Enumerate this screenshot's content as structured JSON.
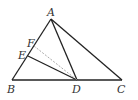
{
  "diagram": {
    "type": "geometry-triangle",
    "points": {
      "A": {
        "label": "A",
        "x": 51,
        "y": 19
      },
      "B": {
        "label": "B",
        "x": 12,
        "y": 80
      },
      "C": {
        "label": "C",
        "x": 122,
        "y": 80
      },
      "D": {
        "label": "D",
        "x": 77,
        "y": 80
      },
      "E": {
        "label": "E",
        "x": 28,
        "y": 56
      },
      "F": {
        "label": "F",
        "x": 34,
        "y": 46
      }
    },
    "segments": [
      {
        "from": "A",
        "to": "B",
        "style": "solid"
      },
      {
        "from": "A",
        "to": "C",
        "style": "solid"
      },
      {
        "from": "B",
        "to": "C",
        "style": "solid"
      },
      {
        "from": "A",
        "to": "D",
        "style": "solid"
      },
      {
        "from": "E",
        "to": "D",
        "style": "solid"
      },
      {
        "from": "F",
        "to": "D",
        "style": "dashed"
      }
    ],
    "colors": {
      "line": "#222222",
      "dashed": "#aaaaaa",
      "label": "#333333"
    }
  }
}
